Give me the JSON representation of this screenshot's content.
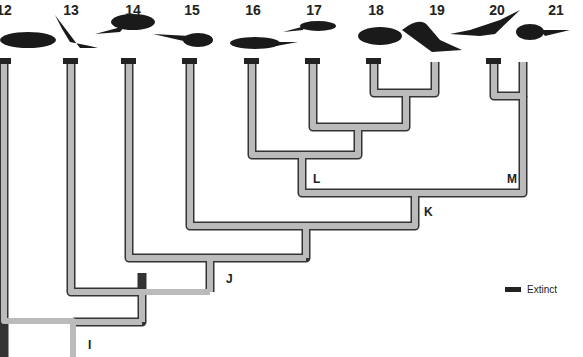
{
  "taxa": [
    {
      "label": "12",
      "x": 4,
      "extinct": true
    },
    {
      "label": "13",
      "x": 71,
      "extinct": true
    },
    {
      "label": "14",
      "x": 129,
      "extinct": true
    },
    {
      "label": "15",
      "x": 190,
      "extinct": true
    },
    {
      "label": "16",
      "x": 252,
      "extinct": true
    },
    {
      "label": "17",
      "x": 313,
      "extinct": true
    },
    {
      "label": "18",
      "x": 374,
      "extinct": true
    },
    {
      "label": "19",
      "x": 435,
      "extinct": false
    },
    {
      "label": "20",
      "x": 494,
      "extinct": true
    },
    {
      "label": "21",
      "x": 523,
      "extinct": false
    }
  ],
  "nodes": {
    "I": "I",
    "J": "J",
    "K": "K",
    "L": "L",
    "M": "M"
  },
  "legend": {
    "label": "Extinct"
  }
}
